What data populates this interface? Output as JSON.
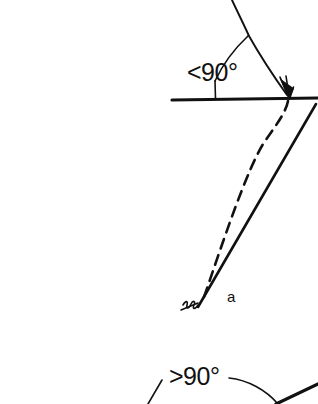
{
  "figure": {
    "background_color": "#ffffff",
    "ink_color": "#111111",
    "width": 318,
    "height": 404
  },
  "labels": {
    "angle_top": "<90°",
    "angle_bottom": ">90°",
    "point_a": "a"
  },
  "annotations": {
    "top_angle_value": "<90°",
    "bottom_angle_value": ">90°",
    "vertex_label": "a"
  },
  "elements": {
    "horizontal_reference_line": "horizontal-reference-line",
    "vertical_tick": "vertical-tick-mark",
    "top_angle_arc": "top-angle-arc",
    "incoming_line": "incoming-slanted-line",
    "arrowhead": "arrowhead",
    "solid_slanted_line": "solid-slanted-line",
    "dashed_curve": "dashed-curve-line",
    "hatch_mark": "hatch-mark",
    "bottom_angle_arc": "bottom-angle-arc",
    "bottom_left_stroke": "bottom-left-stroke",
    "bottom_right_stroke": "bottom-right-stroke"
  }
}
